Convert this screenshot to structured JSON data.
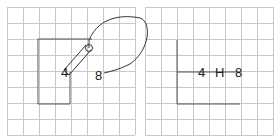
{
  "panels": [
    {
      "name": "before",
      "labels": {
        "left": "4",
        "right": "8"
      },
      "grid": {
        "x0": 7,
        "y0": 7,
        "cols": 8,
        "rows": 8,
        "cell": 16
      },
      "colors": {
        "grid": "#c8c8c8",
        "outline": "#555555",
        "ink": "#222222"
      }
    },
    {
      "name": "after",
      "labels": {
        "left": "4",
        "middle": "H",
        "right": "8"
      },
      "grid": {
        "x0": 145,
        "y0": 7,
        "cols": 8,
        "rows": 8,
        "cell": 16
      },
      "colors": {
        "grid": "#c8c8c8",
        "outline": "#555555",
        "ink": "#222222"
      }
    }
  ]
}
